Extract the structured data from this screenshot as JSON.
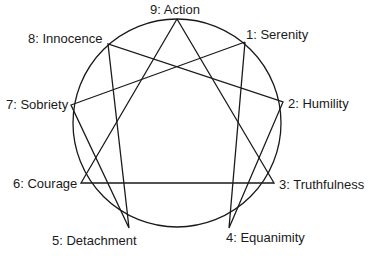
{
  "diagram": {
    "type": "enneagram",
    "circle": {
      "cx": 177,
      "cy": 123,
      "r": 104
    },
    "stroke_color": "#1a1a1a",
    "points": [
      {
        "id": 9,
        "label": "9: Action",
        "x": 177,
        "y": 19
      },
      {
        "id": 1,
        "label": "1: Serenity",
        "x": 245,
        "y": 42
      },
      {
        "id": 2,
        "label": "2: Humility",
        "x": 283,
        "y": 102
      },
      {
        "id": 3,
        "label": "3: Truthfulness",
        "x": 274,
        "y": 183
      },
      {
        "id": 4,
        "label": "4: Equanimity",
        "x": 229,
        "y": 228
      },
      {
        "id": 5,
        "label": "5: Detachment",
        "x": 129,
        "y": 228
      },
      {
        "id": 6,
        "label": "6: Courage",
        "x": 81,
        "y": 183
      },
      {
        "id": 7,
        "label": "7: Sobriety",
        "x": 71,
        "y": 105
      },
      {
        "id": 8,
        "label": "8: Innocence",
        "x": 108,
        "y": 44
      }
    ],
    "hexad": [
      1,
      4,
      2,
      8,
      5,
      7,
      1
    ],
    "triangle": [
      9,
      3,
      6,
      9
    ]
  }
}
